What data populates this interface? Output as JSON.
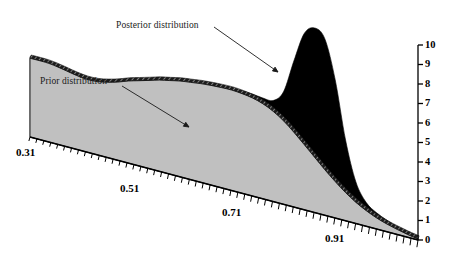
{
  "figure": {
    "background": "#ffffff",
    "prior_fill": "#c0c0c0",
    "posterior_fill": "#000000",
    "outline": "#111111"
  },
  "annotations": [
    {
      "name": "posterior-label",
      "text": "Posterior distribution",
      "x": 116,
      "y": 20,
      "arrow": {
        "x1": 214,
        "y1": 27,
        "x2": 278,
        "y2": 72
      }
    },
    {
      "name": "prior-label",
      "text": "Prior distribution",
      "x": 40,
      "y": 76,
      "arrow": {
        "x1": 122,
        "y1": 86,
        "x2": 189,
        "y2": 127
      }
    }
  ],
  "axis": {
    "x_labels": [
      {
        "text": "0.31",
        "x": 16,
        "y": 146
      },
      {
        "text": "0.51",
        "x": 120,
        "y": 182
      },
      {
        "text": "0.71",
        "x": 222,
        "y": 206
      },
      {
        "text": "0.91",
        "x": 325,
        "y": 232
      }
    ],
    "y_labels": [
      "0",
      "1",
      "2",
      "3",
      "4",
      "5",
      "6",
      "7",
      "8",
      "9",
      "10"
    ],
    "y_axis_x": 418,
    "y_top_px": 45,
    "y_bottom_px": 240
  },
  "chart_data": {
    "type": "area",
    "title": "",
    "subtitle": "",
    "xlabel": "",
    "ylabel": "",
    "projection": "3d-perspective-area",
    "grid": false,
    "legend": "inline-annotations",
    "xlim": [
      0.26,
      1.01
    ],
    "ylim": [
      0,
      10
    ],
    "x_tick_labels": [
      "0.31",
      "0.51",
      "0.71",
      "0.91"
    ],
    "y_tick_labels": [
      "0",
      "1",
      "2",
      "3",
      "4",
      "5",
      "6",
      "7",
      "8",
      "9",
      "10"
    ],
    "x": [
      0.26,
      0.29,
      0.31,
      0.33,
      0.35,
      0.37,
      0.39,
      0.41,
      0.43,
      0.45,
      0.47,
      0.49,
      0.51,
      0.53,
      0.55,
      0.57,
      0.59,
      0.61,
      0.63,
      0.65,
      0.67,
      0.69,
      0.71,
      0.73,
      0.75,
      0.77,
      0.79,
      0.81,
      0.83,
      0.85,
      0.87,
      0.89,
      0.91,
      0.93,
      0.95,
      0.97,
      0.99,
      1.01
    ],
    "series": [
      {
        "name": "Prior distribution",
        "color": "#c0c0c0",
        "values": [
          5.05,
          5.0,
          4.9,
          4.75,
          4.6,
          4.5,
          4.5,
          4.6,
          4.75,
          4.95,
          5.1,
          5.25,
          5.4,
          5.5,
          5.6,
          5.65,
          5.7,
          5.72,
          5.72,
          5.7,
          5.62,
          5.5,
          5.3,
          5.0,
          4.6,
          4.1,
          3.55,
          3.0,
          2.45,
          1.95,
          1.5,
          1.12,
          0.82,
          0.58,
          0.4,
          0.26,
          0.14,
          0.05
        ]
      },
      {
        "name": "Posterior distribution",
        "color": "#000000",
        "values": [
          5.15,
          5.1,
          5.0,
          4.85,
          4.7,
          4.6,
          4.6,
          4.7,
          4.85,
          5.02,
          5.18,
          5.32,
          5.46,
          5.56,
          5.66,
          5.72,
          5.78,
          5.8,
          5.82,
          5.82,
          5.78,
          5.72,
          5.62,
          5.6,
          6.2,
          8.0,
          9.6,
          10.0,
          9.5,
          7.4,
          4.3,
          2.2,
          1.25,
          0.85,
          0.6,
          0.4,
          0.22,
          0.08
        ]
      }
    ]
  }
}
